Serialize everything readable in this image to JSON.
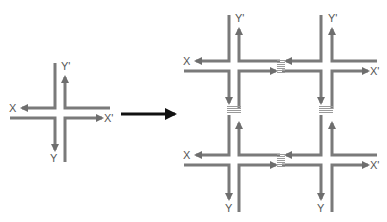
{
  "diagram": {
    "colors": {
      "line": "#7a7a7a",
      "arrow": "#6e6e6e",
      "transform_arrow": "#111111",
      "label": "#555555",
      "connector": "#9a9a9a"
    },
    "single_junction": {
      "labels": {
        "x": "X",
        "x_prime": "X'",
        "y": "Y",
        "y_prime": "Y'"
      }
    },
    "transform_arrow": {
      "icon": "right-arrow-icon"
    },
    "grid_2x2": {
      "top_left": {
        "x": "X",
        "y_prime": "Y'"
      },
      "top_right": {
        "y_prime": "Y'"
      },
      "bottom_left": {
        "x": "X",
        "y": "Y"
      },
      "bottom_right": {
        "y": "Y",
        "x_prime": "X'"
      },
      "top_right_x_prime": "X'"
    }
  }
}
